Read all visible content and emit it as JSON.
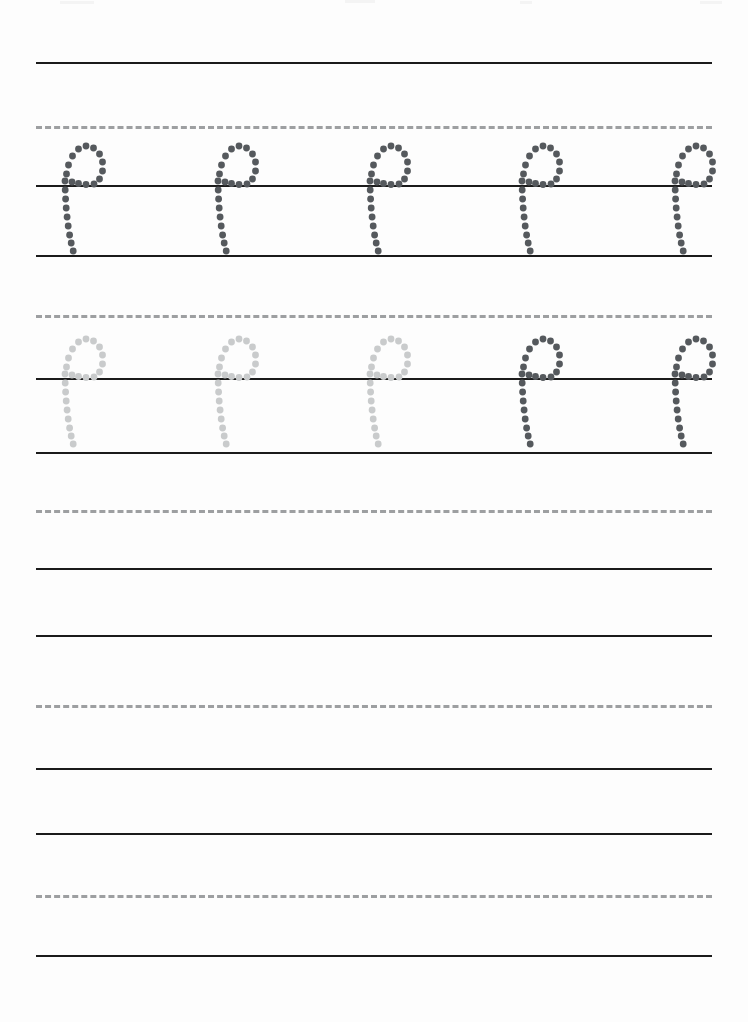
{
  "page": {
    "letter": "p",
    "letter_case": "lowercase",
    "width": 748,
    "height": 1022,
    "background_color": "#fdfdfd"
  },
  "colors": {
    "solid_rule": "#1b1b1b",
    "dashed_rule": "#9d9fa1",
    "trace_dark": "#55595d",
    "trace_light": "#c9cbcc"
  },
  "rules": [
    {
      "name": "rule-1-top",
      "y": 62,
      "style": "solid"
    },
    {
      "name": "rule-1-midline",
      "y": 126,
      "style": "dashed"
    },
    {
      "name": "rule-1-baseline",
      "y": 185,
      "style": "solid"
    },
    {
      "name": "rule-1-descender",
      "y": 255,
      "style": "solid"
    },
    {
      "name": "rule-2-midline",
      "y": 315,
      "style": "dashed"
    },
    {
      "name": "rule-2-baseline",
      "y": 378,
      "style": "solid"
    },
    {
      "name": "rule-2-descender",
      "y": 452,
      "style": "solid"
    },
    {
      "name": "rule-3-midline",
      "y": 510,
      "style": "dashed"
    },
    {
      "name": "rule-3-baseline",
      "y": 568,
      "style": "solid"
    },
    {
      "name": "rule-3-descender",
      "y": 635,
      "style": "solid"
    },
    {
      "name": "rule-4-midline",
      "y": 705,
      "style": "dashed"
    },
    {
      "name": "rule-4-baseline",
      "y": 768,
      "style": "solid"
    },
    {
      "name": "rule-4-descender",
      "y": 833,
      "style": "solid"
    },
    {
      "name": "rule-5-midline",
      "y": 895,
      "style": "dashed"
    },
    {
      "name": "rule-5-baseline",
      "y": 955,
      "style": "solid"
    }
  ],
  "rule_geometry": {
    "left": 36,
    "right": 712,
    "solid_thickness": 2,
    "dash_thickness": 3,
    "dash_length": 12,
    "dash_gap": 6
  },
  "practice_rows": [
    {
      "name": "practice-row-1",
      "baseline_y": 185,
      "midline_y": 126,
      "descender_y": 255,
      "filled": true,
      "letters": [
        {
          "char": "p",
          "x": 65,
          "shade": "dark"
        },
        {
          "char": "p",
          "x": 218,
          "shade": "dark"
        },
        {
          "char": "p",
          "x": 370,
          "shade": "dark"
        },
        {
          "char": "p",
          "x": 522,
          "shade": "dark"
        },
        {
          "char": "p",
          "x": 675,
          "shade": "dark"
        }
      ]
    },
    {
      "name": "practice-row-2",
      "baseline_y": 378,
      "midline_y": 315,
      "descender_y": 452,
      "filled": true,
      "letters": [
        {
          "char": "p",
          "x": 65,
          "shade": "light"
        },
        {
          "char": "p",
          "x": 218,
          "shade": "light"
        },
        {
          "char": "p",
          "x": 370,
          "shade": "light"
        },
        {
          "char": "p",
          "x": 522,
          "shade": "dark"
        },
        {
          "char": "p",
          "x": 675,
          "shade": "dark"
        }
      ]
    },
    {
      "name": "practice-row-3",
      "baseline_y": 568,
      "midline_y": 510,
      "descender_y": 635,
      "filled": false,
      "letters": []
    },
    {
      "name": "practice-row-4",
      "baseline_y": 768,
      "midline_y": 705,
      "descender_y": 833,
      "filled": false,
      "letters": []
    },
    {
      "name": "practice-row-5",
      "baseline_y": 955,
      "midline_y": 895,
      "descender_y": 1022,
      "filled": false,
      "letters": []
    }
  ],
  "glyph_template": {
    "name": "dotted-letter-p",
    "dot_radius": 3.4,
    "stem_dots": [
      {
        "x": 0,
        "y": -4
      },
      {
        "x": 0.2,
        "y": 5
      },
      {
        "x": 0.6,
        "y": 14
      },
      {
        "x": 1.2,
        "y": 23
      },
      {
        "x": 2.1,
        "y": 32
      },
      {
        "x": 3.2,
        "y": 41
      },
      {
        "x": 4.6,
        "y": 50
      },
      {
        "x": 6.2,
        "y": 58
      },
      {
        "x": 8.2,
        "y": 66
      }
    ],
    "bowl_dots": [
      {
        "x": 1.5,
        "y": -11
      },
      {
        "x": 3.5,
        "y": -20
      },
      {
        "x": 7.5,
        "y": -29
      },
      {
        "x": 13.5,
        "y": -36
      },
      {
        "x": 21,
        "y": -39
      },
      {
        "x": 28.5,
        "y": -37
      },
      {
        "x": 34.5,
        "y": -31
      },
      {
        "x": 37.5,
        "y": -23
      },
      {
        "x": 37.5,
        "y": -14
      },
      {
        "x": 34.5,
        "y": -6
      },
      {
        "x": 29,
        "y": -1
      },
      {
        "x": 21,
        "y": -0.5
      },
      {
        "x": 13.5,
        "y": -1.5
      },
      {
        "x": 7,
        "y": -3
      }
    ]
  },
  "speckles": [
    {
      "x": 60,
      "y": 1,
      "w": 34
    },
    {
      "x": 345,
      "y": 0,
      "w": 30
    },
    {
      "x": 520,
      "y": 1,
      "w": 12
    },
    {
      "x": 700,
      "y": 1,
      "w": 22
    }
  ]
}
